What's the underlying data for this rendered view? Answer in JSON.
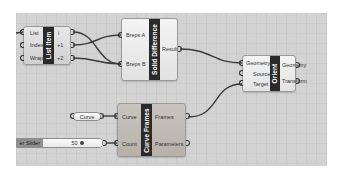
{
  "canvas": {
    "background": "#d3d3d3"
  },
  "nodes": {
    "list_item": {
      "title": "List Item",
      "inputs": [
        "List",
        "Index",
        "Wrap"
      ],
      "outputs": [
        "i",
        "+1",
        "+2"
      ]
    },
    "solid_difference": {
      "title": "Solid Difference",
      "inputs": [
        "Breps A",
        "Breps B"
      ],
      "outputs": [
        "Result"
      ]
    },
    "orient": {
      "title": "Orient",
      "inputs": [
        "Geometry",
        "Source",
        "Target"
      ],
      "outputs": [
        "Geometry",
        "Transform"
      ]
    },
    "curve_frames": {
      "title": "Curve Frames",
      "inputs": [
        "Curve",
        "Count"
      ],
      "outputs": [
        "Frames",
        "Parameters"
      ]
    },
    "curve_param": {
      "label": "Curve"
    },
    "number_slider": {
      "label": "er Slider",
      "value": "50"
    }
  },
  "wires": [
    {
      "from": "list_item.i",
      "to": "solid_difference.Breps B"
    },
    {
      "from": "list_item.+1",
      "to": "solid_difference.Breps A"
    },
    {
      "from": "list_item.+2",
      "to": "solid_difference.Breps B"
    },
    {
      "from": "solid_difference.Result",
      "to": "orient.Geometry"
    },
    {
      "from": "curve_frames.Frames",
      "to": "orient.Target"
    },
    {
      "from": "curve_param",
      "to": "curve_frames.Curve"
    },
    {
      "from": "number_slider",
      "to": "curve_frames.Count"
    }
  ]
}
